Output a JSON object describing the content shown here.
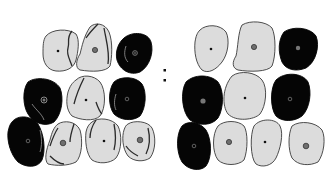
{
  "figure": {
    "separator": "colon",
    "colors": {
      "light_cell": "#dcdcdc",
      "dark_cell": "#050505",
      "outline": "#3a3a3a",
      "nucleus_dark": "#111111",
      "nucleus_gray": "#6f6f6f"
    },
    "panels": [
      {
        "name": "left-panel",
        "cells": [
          {
            "id": "L1",
            "type": "light",
            "cx": 58,
            "cy": 51,
            "nucleus": "dot",
            "creased": true
          },
          {
            "id": "L2",
            "type": "light",
            "cx": 95,
            "cy": 50,
            "nucleus": "granular",
            "creased": true
          },
          {
            "id": "L3",
            "type": "dark",
            "cx": 135,
            "cy": 53,
            "nucleus": "ring",
            "creased": true
          },
          {
            "id": "L4",
            "type": "dark",
            "cx": 43,
            "cy": 101,
            "nucleus": "ring",
            "creased": true
          },
          {
            "id": "L5",
            "type": "light",
            "cx": 86,
            "cy": 100,
            "nucleus": "dot",
            "creased": true
          },
          {
            "id": "L6",
            "type": "dark",
            "cx": 127,
            "cy": 99,
            "nucleus": "ring",
            "creased": true
          },
          {
            "id": "L7",
            "type": "dark",
            "cx": 27,
            "cy": 141,
            "nucleus": "ring",
            "creased": true
          },
          {
            "id": "L8",
            "type": "light",
            "cx": 63,
            "cy": 144,
            "nucleus": "granular",
            "creased": true
          },
          {
            "id": "L9",
            "type": "light",
            "cx": 104,
            "cy": 141,
            "nucleus": "dot",
            "creased": true
          },
          {
            "id": "L10",
            "type": "light",
            "cx": 140,
            "cy": 140,
            "nucleus": "granular",
            "creased": true
          }
        ]
      },
      {
        "name": "right-panel",
        "cells": [
          {
            "id": "R1",
            "type": "light",
            "cx": 211,
            "cy": 49,
            "nucleus": "dot",
            "creased": false
          },
          {
            "id": "R2",
            "type": "light",
            "cx": 254,
            "cy": 47,
            "nucleus": "granular",
            "creased": false
          },
          {
            "id": "R3",
            "type": "dark",
            "cx": 298,
            "cy": 48,
            "nucleus": "granular",
            "creased": false
          },
          {
            "id": "R4",
            "type": "dark",
            "cx": 203,
            "cy": 100,
            "nucleus": "granular",
            "creased": false
          },
          {
            "id": "R5",
            "type": "light",
            "cx": 245,
            "cy": 97,
            "nucleus": "dot",
            "creased": false
          },
          {
            "id": "R6",
            "type": "dark",
            "cx": 290,
            "cy": 99,
            "nucleus": "ring",
            "creased": false
          },
          {
            "id": "R7",
            "type": "dark",
            "cx": 193,
            "cy": 146,
            "nucleus": "ring",
            "creased": false
          },
          {
            "id": "R8",
            "type": "light",
            "cx": 229,
            "cy": 143,
            "nucleus": "granular",
            "creased": false
          },
          {
            "id": "R9",
            "type": "light",
            "cx": 265,
            "cy": 142,
            "nucleus": "dot",
            "creased": false
          },
          {
            "id": "R10",
            "type": "light",
            "cx": 306,
            "cy": 146,
            "nucleus": "granular",
            "creased": false
          }
        ]
      }
    ]
  }
}
